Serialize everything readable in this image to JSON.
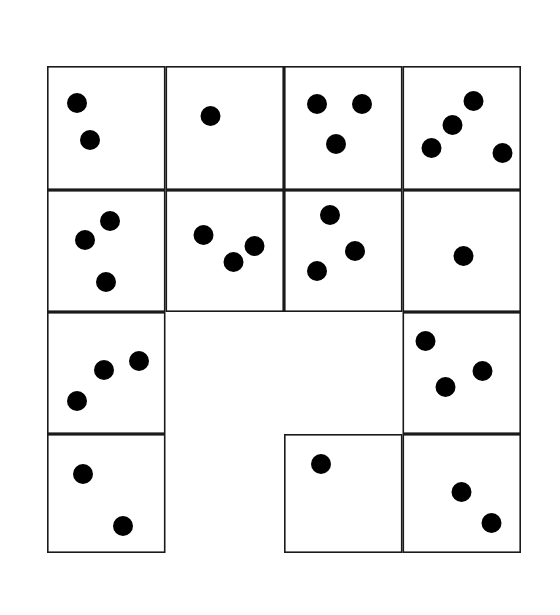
{
  "figure": {
    "title": "",
    "canvas": {
      "width": 560,
      "height": 615
    },
    "background_color": "#ffffff"
  },
  "style": {
    "dot_color": "#000000",
    "dot_radius": 10,
    "cell_border_color": "#1a1a1a",
    "cell_border_width": 1.6,
    "cell_fill": "#ffffff"
  },
  "grid": {
    "columns": 4,
    "rows": 4,
    "x_lines": [
      47,
      165.5,
      284,
      402.5,
      521
    ],
    "y_lines": [
      66,
      190,
      312,
      434,
      553
    ],
    "cell_width": 118.5,
    "cell_height": 121.75,
    "total_cells_drawn": 13,
    "empty_positions": [
      {
        "row": 3,
        "col": 2
      },
      {
        "row": 3,
        "col": 3
      },
      {
        "row": 4,
        "col": 2
      }
    ]
  },
  "cells": [
    {
      "id": "cell-r1c1",
      "row": 1,
      "col": 2,
      "x": 47,
      "y": 66,
      "w": 118.5,
      "h": 124,
      "dot_count": 2,
      "dots": [
        {
          "cx": 30,
          "cy": 37
        },
        {
          "cx": 43,
          "cy": 74
        }
      ]
    },
    {
      "id": "cell-r1c2",
      "row": 1,
      "col": 2,
      "x": 165.5,
      "y": 66,
      "w": 118.5,
      "h": 124,
      "dot_count": 1,
      "dots": [
        {
          "cx": 45,
          "cy": 50
        }
      ]
    },
    {
      "id": "cell-r1c3",
      "row": 1,
      "col": 3,
      "x": 284,
      "y": 66,
      "w": 118.5,
      "h": 124,
      "dot_count": 3,
      "dots": [
        {
          "cx": 33,
          "cy": 38
        },
        {
          "cx": 78,
          "cy": 38
        },
        {
          "cx": 52,
          "cy": 78
        }
      ]
    },
    {
      "id": "cell-r1c4",
      "row": 1,
      "col": 4,
      "x": 402.5,
      "y": 66,
      "w": 118.5,
      "h": 124,
      "dot_count": 4,
      "dots": [
        {
          "cx": 71,
          "cy": 35
        },
        {
          "cx": 50,
          "cy": 59
        },
        {
          "cx": 29,
          "cy": 82
        },
        {
          "cx": 100,
          "cy": 87
        }
      ]
    },
    {
      "id": "cell-r2c1",
      "row": 2,
      "col": 1,
      "x": 47,
      "y": 190,
      "w": 118.5,
      "h": 122,
      "dot_count": 3,
      "dots": [
        {
          "cx": 63,
          "cy": 31
        },
        {
          "cx": 38,
          "cy": 50
        },
        {
          "cx": 59,
          "cy": 92
        }
      ]
    },
    {
      "id": "cell-r2c2",
      "row": 2,
      "col": 2,
      "x": 165.5,
      "y": 190,
      "w": 118.5,
      "h": 122,
      "dot_count": 3,
      "dots": [
        {
          "cx": 38,
          "cy": 45
        },
        {
          "cx": 68,
          "cy": 72
        },
        {
          "cx": 89,
          "cy": 56
        }
      ]
    },
    {
      "id": "cell-r2c3",
      "row": 2,
      "col": 3,
      "x": 284,
      "y": 190,
      "w": 118.5,
      "h": 122,
      "dot_count": 3,
      "dots": [
        {
          "cx": 46,
          "cy": 25
        },
        {
          "cx": 71,
          "cy": 61
        },
        {
          "cx": 33,
          "cy": 81
        }
      ]
    },
    {
      "id": "cell-r2c4",
      "row": 2,
      "col": 4,
      "x": 402.5,
      "y": 190,
      "w": 118.5,
      "h": 122,
      "dot_count": 1,
      "dots": [
        {
          "cx": 61,
          "cy": 66
        }
      ]
    },
    {
      "id": "cell-r3c1",
      "row": 3,
      "col": 1,
      "x": 47,
      "y": 312,
      "w": 118.5,
      "h": 122,
      "dot_count": 3,
      "dots": [
        {
          "cx": 92,
          "cy": 49
        },
        {
          "cx": 57,
          "cy": 58
        },
        {
          "cx": 30,
          "cy": 89
        }
      ]
    },
    {
      "id": "cell-r3c4",
      "row": 3,
      "col": 4,
      "x": 402.5,
      "y": 312,
      "w": 118.5,
      "h": 122,
      "dot_count": 3,
      "dots": [
        {
          "cx": 23,
          "cy": 29
        },
        {
          "cx": 80,
          "cy": 59
        },
        {
          "cx": 43,
          "cy": 75
        }
      ]
    },
    {
      "id": "cell-r4c1",
      "row": 4,
      "col": 1,
      "x": 47,
      "y": 434,
      "w": 118.5,
      "h": 119,
      "dot_count": 2,
      "dots": [
        {
          "cx": 36,
          "cy": 40
        },
        {
          "cx": 76,
          "cy": 92
        }
      ]
    },
    {
      "id": "cell-r4c3",
      "row": 4,
      "col": 3,
      "x": 284,
      "y": 434,
      "w": 118.5,
      "h": 119,
      "dot_count": 1,
      "dots": [
        {
          "cx": 37,
          "cy": 30
        }
      ]
    },
    {
      "id": "cell-r4c4",
      "row": 4,
      "col": 4,
      "x": 402.5,
      "y": 434,
      "w": 118.5,
      "h": 119,
      "dot_count": 2,
      "dots": [
        {
          "cx": 59,
          "cy": 58
        },
        {
          "cx": 89,
          "cy": 89
        }
      ]
    }
  ]
}
